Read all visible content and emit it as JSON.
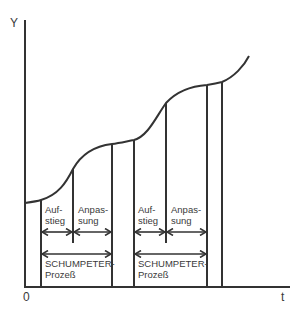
{
  "axes": {
    "y_label": "Y",
    "x_label": "t",
    "origin_label": "0"
  },
  "cycles": [
    {
      "rise_label_line1": "Auf-",
      "rise_label_line2": "stieg",
      "adjust_label_line1": "Anpas-",
      "adjust_label_line2": "sung",
      "process_label_line1": "SCHUMPETER-",
      "process_label_line2": "Prozeß"
    },
    {
      "rise_label_line1": "Auf-",
      "rise_label_line2": "stieg",
      "adjust_label_line1": "Anpas-",
      "adjust_label_line2": "sung",
      "process_label_line1": "SCHUMPETER-",
      "process_label_line2": "Prozeß"
    }
  ],
  "colors": {
    "line": "#333333",
    "text": "#3a3a3a"
  }
}
